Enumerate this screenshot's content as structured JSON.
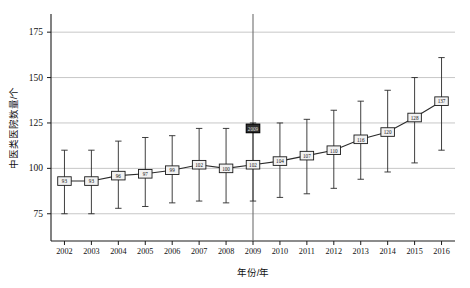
{
  "chart_data": {
    "type": "line",
    "title": "",
    "subtitle": "",
    "xlabel": "年份/年",
    "ylabel": "中医类医院数量/个",
    "categories": [
      "2002",
      "2003",
      "2004",
      "2005",
      "2006",
      "2007",
      "2008",
      "2009",
      "2010",
      "2011",
      "2012",
      "2013",
      "2014",
      "2015",
      "2016"
    ],
    "values": [
      93,
      93,
      96,
      97,
      99,
      102,
      100,
      102,
      104,
      107,
      110,
      116,
      120,
      128,
      137
    ],
    "point_labels": [
      "93",
      "93",
      "96",
      "97",
      "99",
      "102",
      "100",
      "102",
      "104",
      "107",
      "110",
      "116",
      "120",
      "128",
      "137"
    ],
    "error_low": [
      75,
      75,
      78,
      79,
      81,
      82,
      81,
      82,
      84,
      86,
      89,
      94,
      98,
      103,
      110
    ],
    "error_high": [
      110,
      110,
      115,
      117,
      118,
      122,
      122,
      125,
      125,
      127,
      132,
      137,
      143,
      150,
      161
    ],
    "ylim": [
      60,
      185
    ],
    "yticks": [
      75,
      100,
      125,
      150,
      175
    ],
    "ytick_labels": [
      "75",
      "100",
      "125",
      "150",
      "175"
    ],
    "grid": true,
    "grid_axis": "y",
    "legend": "none",
    "annotations": [
      {
        "name": "highlighted-point-2009",
        "category": "2009",
        "value": 122,
        "label": "2009",
        "style": "dark-filled-box"
      },
      {
        "name": "reference-line-2009",
        "category": "2009",
        "style": "vertical-line"
      }
    ],
    "colors": {
      "line": "#2a2a2a",
      "marker_fill": "#f2f2f2",
      "marker_stroke": "#1a1a1a",
      "highlight_fill": "#2e2e2e",
      "grid": "#b9b9b9",
      "axis": "#1a1a1a",
      "reference_line": "#6f6f6f",
      "background": "#ffffff"
    }
  }
}
